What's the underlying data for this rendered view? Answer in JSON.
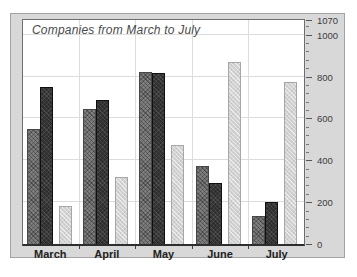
{
  "chart_data": {
    "type": "bar",
    "title": "Companies from March to July",
    "categories": [
      "March",
      "April",
      "May",
      "June",
      "July"
    ],
    "series": [
      {
        "name": "series-1",
        "color": "#7e7e7e",
        "values": [
          550,
          645,
          820,
          375,
          135
        ]
      },
      {
        "name": "series-2",
        "color": "#2d2d2d",
        "values": [
          750,
          690,
          815,
          290,
          200
        ]
      },
      {
        "name": "series-3",
        "color": "#d2d2d2",
        "values": [
          180,
          320,
          475,
          870,
          775
        ]
      }
    ],
    "xlabel": "",
    "ylabel": "",
    "ylim": [
      0,
      1070
    ],
    "y_ticks": [
      0,
      200,
      400,
      600,
      800,
      1000,
      1070
    ],
    "y_minor_step": 40,
    "grid": true,
    "legend_position": "none",
    "y_axis_side": "right"
  },
  "colors": {
    "panel_background": "#d8d8d8",
    "plot_background": "#ffffff",
    "gridline": "#dcdcdc",
    "axis_text": "#3c3c3c",
    "title_text": "#4a4a4a"
  }
}
